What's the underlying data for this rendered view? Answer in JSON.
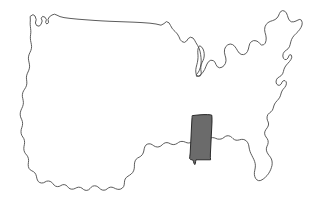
{
  "map": {
    "title": "United States outline map",
    "subject": "Mississippi",
    "description": "Black and white outline map of the contiguous United States with the state of Mississippi filled in gray",
    "projection_note": "contiguous-48",
    "background_color": "#ffffff",
    "outline_color": "#4a4a4a",
    "highlight_fill_color": "#6b6b6b",
    "highlight_stroke_color": "#1c1c1c",
    "width": 316,
    "height": 200,
    "features": [
      {
        "name": "contiguous-united-states-outline",
        "label": "Contiguous United States",
        "type": "outline",
        "highlighted": false
      },
      {
        "name": "great-lakes",
        "label": "Great Lakes",
        "type": "water-outline",
        "highlighted": false
      },
      {
        "name": "mississippi",
        "label": "Mississippi",
        "type": "state",
        "highlighted": true
      }
    ],
    "geometry": {
      "country": "M 30.5,16.2 L 33.0,14.6 L 35.0,16.0 L 36.2,19.5 L 35.4,23.0 L 36.6,25.5 L 39.0,26.2 L 41.0,24.5 L 42.2,21.0 L 41.2,18.2 L 42.6,16.4 L 45.0,17.2 L 46.4,19.6 L 45.6,22.4 L 46.8,24.0 L 48.6,22.6 L 48.0,19.4 L 49.4,16.8 L 52.0,15.0 L 54.5,14.2 L 57.0,15.2 L 60.0,16.6 L 64.0,17.6 L 70.0,18.4 L 78.0,19.2 L 86.0,19.8 L 94.0,20.4 L 102.0,20.9 L 110.0,21.3 L 118.0,21.6 L 126.0,21.9 L 134.0,22.2 L 142.0,22.6 L 150.0,23.2 L 156.0,24.0 L 161.0,25.2 L 164.0,23.6 L 166.4,21.6 L 169.0,22.8 L 170.6,25.6 L 172.4,28.8 L 175.0,31.4 L 177.4,34.0 L 179.0,36.8 L 180.2,39.6 L 182.0,41.6 L 184.4,42.4 L 186.6,41.0 L 188.2,38.6 L 190.4,37.2 L 193.0,38.0 L 194.6,40.2 L 196.0,42.8 L 197.6,45.4 L 199.0,48.2 L 200.0,51.2 L 200.6,54.4 L 201.0,57.6 L 201.2,60.8 L 201.0,64.0 L 200.4,67.2 L 199.4,70.2 L 198.0,72.8 L 196.2,74.6 L 196.6,76.4 L 198.8,76.0 L 201.0,74.4 L 203.0,72.2 L 204.6,69.6 L 205.8,66.8 L 207.0,64.0 L 208.6,61.6 L 210.8,60.2 L 213.2,60.6 L 215.0,62.2 L 216.0,64.6 L 217.4,66.8 L 219.6,67.8 L 222.0,67.2 L 224.0,65.6 L 225.4,63.4 L 226.0,60.8 L 225.8,58.0 L 225.0,55.2 L 224.4,52.2 L 224.6,49.2 L 225.8,46.6 L 227.8,44.8 L 230.2,44.0 L 232.6,44.6 L 234.6,46.2 L 236.2,48.4 L 237.6,50.8 L 239.2,53.0 L 241.2,54.4 L 243.6,54.6 L 245.8,53.6 L 247.4,51.6 L 248.4,49.0 L 249.0,46.2 L 249.8,43.6 L 251.4,41.6 L 253.6,40.6 L 256.0,40.8 L 258.2,41.8 L 259.8,43.6 L 261.4,45.0 L 263.6,44.8 L 265.2,43.2 L 266.0,40.8 L 266.2,38.0 L 265.8,35.2 L 265.0,32.4 L 264.6,29.6 L 265.0,26.8 L 266.2,24.4 L 268.0,22.6 L 270.2,21.4 L 272.6,20.6 L 275.0,19.6 L 277.0,18.0 L 278.4,16.0 L 279.4,13.6 L 280.6,11.6 L 282.6,10.6 L 284.8,11.2 L 286.4,13.0 L 287.4,15.4 L 288.2,18.0 L 289.4,20.4 L 291.4,21.8 L 293.8,21.8 L 296.0,21.0 L 298.0,20.0 L 299.8,19.4 L 301.4,20.2 L 302.2,22.4 L 302.0,25.0 L 301.0,27.4 L 299.6,29.6 L 298.0,31.6 L 296.2,33.4 L 294.4,35.2 L 292.8,37.2 L 291.6,39.4 L 290.8,41.8 L 290.2,44.4 L 289.4,46.8 L 288.0,48.8 L 286.2,50.2 L 284.4,51.6 L 283.2,53.6 L 282.8,56.0 L 283.4,58.2 L 284.8,59.6 L 286.6,59.4 L 288.0,58.0 L 288.8,56.0 L 289.8,54.6 L 291.4,55.2 L 291.8,57.2 L 291.0,59.4 L 289.6,61.4 L 288.0,63.2 L 286.4,65.0 L 285.0,67.0 L 284.0,69.2 L 283.4,71.6 L 282.6,73.8 L 281.2,75.6 L 279.4,76.8 L 277.6,78.0 L 276.4,79.8 L 276.0,82.0 L 276.6,84.0 L 278.0,85.2 L 279.8,85.2 L 281.2,84.0 L 282.0,82.2 L 283.2,80.8 L 285.0,80.6 L 286.2,81.8 L 286.4,83.8 L 285.8,85.8 L 284.6,87.6 L 283.2,89.2 L 282.0,91.0 L 281.2,93.0 L 280.6,95.2 L 279.8,97.2 L 278.6,99.0 L 277.2,100.6 L 275.8,102.2 L 274.6,104.0 L 273.8,106.0 L 273.2,108.2 L 272.4,110.2 L 271.0,111.8 L 269.4,113.0 L 268.0,114.4 L 267.2,116.2 L 267.0,118.2 L 267.4,120.2 L 268.2,122.0 L 268.6,124.0 L 268.2,126.0 L 267.2,127.8 L 266.0,129.4 L 265.0,131.2 L 264.6,133.2 L 265.0,135.2 L 266.0,137.0 L 267.2,138.6 L 268.0,140.4 L 268.2,142.4 L 267.8,144.4 L 267.0,146.2 L 266.4,148.2 L 266.4,150.2 L 267.0,152.2 L 268.0,154.0 L 269.2,155.6 L 270.4,157.2 L 271.4,159.0 L 272.0,161.0 L 272.2,163.2 L 272.0,165.4 L 271.4,167.6 L 270.6,169.8 L 269.6,171.8 L 268.4,173.8 L 267.0,175.6 L 265.4,177.2 L 263.8,178.6 L 262.0,179.8 L 260.2,180.6 L 258.4,180.6 L 256.8,179.8 L 255.6,178.4 L 254.8,176.6 L 254.4,174.6 L 254.4,172.4 L 254.8,170.2 L 255.2,168.0 L 255.4,165.8 L 255.2,163.6 L 254.6,161.4 L 253.8,159.4 L 252.8,157.4 L 251.8,155.4 L 250.8,153.4 L 250.0,151.4 L 249.4,149.2 L 249.0,147.0 L 248.6,144.8 L 247.8,142.8 L 246.6,141.2 L 245.0,140.0 L 243.2,139.4 L 241.4,139.4 L 239.6,139.8 L 237.8,140.2 L 236.0,140.2 L 234.4,139.6 L 233.0,138.6 L 231.8,137.4 L 230.4,136.4 L 228.8,135.8 L 227.0,135.8 L 225.4,136.4 L 224.0,137.4 L 222.6,138.4 L 221.0,139.0 L 219.2,139.2 L 217.4,139.0 L 215.8,138.4 L 214.2,137.8 L 212.4,137.6 L 210.6,138.0 L 209.2,139.0 L 208.0,140.2 L 206.6,141.2 L 204.8,141.6 L 203.0,141.4 L 201.4,140.6 L 200.0,139.6 L 198.4,139.0 L 196.6,139.0 L 195.0,139.6 L 193.6,140.6 L 192.2,141.8 L 190.6,142.6 L 188.8,143.0 L 187.0,142.8 L 185.4,142.2 L 183.8,141.6 L 182.0,141.4 L 180.2,141.6 L 178.6,142.4 L 177.2,143.4 L 175.6,144.2 L 173.8,144.6 L 172.0,144.4 L 170.4,143.8 L 168.8,143.0 L 167.0,142.6 L 165.2,142.8 L 163.6,143.6 L 162.2,144.8 L 160.8,146.0 L 159.0,146.8 L 157.2,147.0 L 155.4,146.6 L 153.8,145.8 L 152.4,144.8 L 150.8,144.0 L 149.0,143.8 L 147.2,144.2 L 145.8,145.2 L 144.8,146.8 L 144.2,148.8 L 143.8,151.0 L 143.2,153.0 L 142.2,154.8 L 140.8,156.2 L 139.2,157.2 L 137.6,158.0 L 136.2,159.2 L 135.2,160.8 L 134.6,162.8 L 134.4,164.8 L 134.4,166.8 L 134.2,168.8 L 133.6,170.8 L 132.6,172.6 L 131.2,174.0 L 129.6,175.2 L 128.0,176.2 L 126.4,177.4 L 125.2,179.0 L 124.6,180.8 L 124.4,182.8 L 124.2,184.8 L 123.6,186.6 L 122.4,188.0 L 120.8,189.0 L 119.0,189.4 L 117.2,189.2 L 115.4,188.6 L 113.8,187.8 L 112.0,187.2 L 110.2,187.2 L 108.6,187.8 L 107.2,188.8 L 105.8,189.8 L 104.0,190.2 L 102.2,190.0 L 100.6,189.2 L 99.2,188.0 L 97.8,186.8 L 96.2,186.0 L 94.4,185.8 L 92.6,186.2 L 91.2,187.2 L 90.0,188.6 L 88.6,189.8 L 86.8,190.4 L 85.0,190.2 L 83.4,189.4 L 82.0,188.2 L 80.4,187.4 L 78.6,187.2 L 76.8,187.6 L 75.2,188.4 L 73.6,189.0 L 71.8,189.2 L 70.0,188.8 L 68.6,187.8 L 67.4,186.4 L 66.0,185.2 L 64.2,184.6 L 62.4,184.8 L 60.8,185.6 L 59.2,186.4 L 57.4,186.6 L 55.6,186.2 L 54.2,185.2 L 53.0,183.8 L 51.8,182.4 L 50.2,181.4 L 48.4,181.0 L 46.6,181.2 L 45.0,182.0 L 43.4,182.8 L 41.6,183.0 L 39.8,182.6 L 38.4,181.6 L 37.4,180.0 L 36.8,178.2 L 36.4,176.2 L 35.8,174.4 L 34.8,172.8 L 33.4,171.6 L 31.8,170.8 L 30.2,169.8 L 29.0,168.4 L 28.4,166.6 L 28.2,164.6 L 28.4,162.6 L 28.6,160.6 L 28.4,158.6 L 27.8,156.8 L 26.8,155.2 L 25.6,153.8 L 24.6,152.2 L 24.0,150.4 L 23.8,148.4 L 24.0,146.4 L 24.4,144.4 L 24.6,142.4 L 24.4,140.4 L 23.8,138.6 L 22.8,137.0 L 21.8,135.4 L 21.2,133.6 L 21.0,131.6 L 21.2,129.6 L 21.8,127.6 L 22.4,125.6 L 22.6,123.6 L 22.4,121.6 L 21.8,119.8 L 21.0,118.0 L 20.4,116.2 L 20.2,114.2 L 20.4,112.2 L 21.0,110.2 L 21.8,108.4 L 22.6,106.6 L 23.2,104.6 L 23.4,102.6 L 23.2,100.6 L 22.8,98.6 L 22.4,96.6 L 22.4,94.6 L 22.8,92.6 L 23.6,90.8 L 24.6,89.2 L 25.6,87.6 L 26.4,85.8 L 26.8,83.8 L 26.8,81.8 L 26.6,79.8 L 26.4,77.8 L 26.6,75.8 L 27.2,73.8 L 28.0,72.0 L 28.8,70.2 L 29.4,68.2 L 29.6,66.2 L 29.4,64.2 L 29.0,62.2 L 28.6,60.2 L 28.4,58.2 L 28.6,56.2 L 29.2,54.2 L 30.0,52.4 L 30.8,50.6 L 31.4,48.6 L 31.6,46.6 L 31.4,44.6 L 31.0,42.6 L 30.6,40.6 L 30.4,38.6 L 30.4,36.6 L 30.6,34.6 L 30.8,32.6 L 30.8,30.6 L 30.6,28.6 L 30.4,26.6 L 30.2,24.6 L 30.2,22.6 L 30.3,20.4 Z",
      "michigan_lake": "M 200.2,46.0 L 201.8,47.2 L 203.0,49.0 L 203.8,51.2 L 204.2,53.6 L 204.2,56.0 L 203.8,58.4 L 203.0,60.6 L 202.0,62.6 L 201.2,64.8 L 200.8,67.2 L 200.8,69.6 L 201.2,72.0 L 201.2,74.2 L 200.4,75.8 L 198.8,76.4 L 197.2,75.8 L 196.2,74.2 L 195.8,72.0 L 195.8,69.6 L 196.2,67.2 L 196.8,64.8 L 197.4,62.4 L 197.8,60.0 L 198.0,57.6 L 198.0,55.2 L 197.8,52.8 L 197.8,50.4 L 198.2,48.2 L 199.0,46.6 Z",
      "mississippi": "M 192.6,115.6 L 196.0,115.2 L 200.0,114.8 L 204.0,114.6 L 207.6,114.6 L 210.4,114.8 L 211.8,115.2 L 212.0,118.0 L 212.0,122.0 L 211.8,126.0 L 211.6,130.0 L 211.4,134.0 L 211.2,138.0 L 211.0,142.0 L 210.8,146.0 L 210.6,150.0 L 210.4,154.0 L 210.4,157.6 L 210.6,159.8 L 207.0,159.8 L 203.0,159.8 L 199.0,159.8 L 196.0,159.8 L 195.6,161.6 L 195.4,163.4 L 194.8,164.6 L 194.0,163.4 L 193.4,161.4 L 192.6,159.8 L 190.6,159.6 L 189.6,158.4 L 189.8,156.2 L 190.2,153.0 L 190.4,149.0 L 190.6,145.0 L 190.8,141.0 L 191.0,137.0 L 191.2,133.0 L 191.4,129.0 L 191.6,125.0 L 191.8,121.0 L 192.0,118.0 Z"
    }
  }
}
